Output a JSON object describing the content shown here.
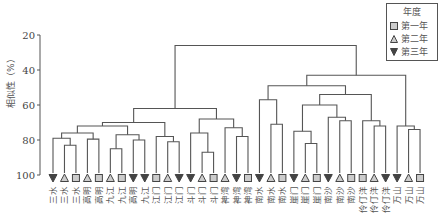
{
  "chart_data": {
    "type": "dendrogram",
    "title": "",
    "ylabel": "相似性（%）",
    "xlabel": "",
    "ylim": [
      20,
      100
    ],
    "yticks": [
      20,
      40,
      60,
      80,
      100
    ],
    "legend": {
      "title": "年度",
      "entries": [
        {
          "label": "第一年",
          "marker": "square"
        },
        {
          "label": "第二年",
          "marker": "triangle-up"
        },
        {
          "label": "第三年",
          "marker": "triangle-down"
        }
      ]
    },
    "leaves": [
      {
        "label": "三水",
        "year": "第三年"
      },
      {
        "label": "三水",
        "year": "第二年"
      },
      {
        "label": "三水",
        "year": "第一年"
      },
      {
        "label": "高明",
        "year": "第二年"
      },
      {
        "label": "高明",
        "year": "第一年"
      },
      {
        "label": "九江",
        "year": "第二年"
      },
      {
        "label": "九江",
        "year": "第一年"
      },
      {
        "label": "高明",
        "year": "第三年"
      },
      {
        "label": "九江",
        "year": "第三年"
      },
      {
        "label": "江门",
        "year": "第一年"
      },
      {
        "label": "江门",
        "year": "第二年"
      },
      {
        "label": "江门",
        "year": "第三年"
      },
      {
        "label": "斗门",
        "year": "第三年"
      },
      {
        "label": "斗门",
        "year": "第二年"
      },
      {
        "label": "斗门",
        "year": "第一年"
      },
      {
        "label": "神湾",
        "year": "第二年"
      },
      {
        "label": "神湾",
        "year": "第三年"
      },
      {
        "label": "神湾",
        "year": "第一年"
      },
      {
        "label": "南水",
        "year": "第三年"
      },
      {
        "label": "南水",
        "year": "第二年"
      },
      {
        "label": "南水",
        "year": "第一年"
      },
      {
        "label": "崖门",
        "year": "第三年"
      },
      {
        "label": "崖门",
        "year": "第二年"
      },
      {
        "label": "崖门",
        "year": "第一年"
      },
      {
        "label": "南沙",
        "year": "第三年"
      },
      {
        "label": "南沙",
        "year": "第二年"
      },
      {
        "label": "南沙",
        "year": "第一年"
      },
      {
        "label": "伶仃洋",
        "year": "第一年"
      },
      {
        "label": "伶仃洋",
        "year": "第二年"
      },
      {
        "label": "伶仃洋",
        "year": "第三年"
      },
      {
        "label": "万山",
        "year": "第三年"
      },
      {
        "label": "万山",
        "year": "第二年"
      },
      {
        "label": "万山",
        "year": "第一年"
      }
    ],
    "merges": [
      {
        "id": "A",
        "children": [
          2,
          3
        ],
        "similarity": 83
      },
      {
        "id": "B",
        "children": [
          1,
          "A"
        ],
        "similarity": 79
      },
      {
        "id": "C",
        "children": [
          4,
          5
        ],
        "similarity": 79.5
      },
      {
        "id": "D",
        "children": [
          "B",
          "C"
        ],
        "similarity": 76
      },
      {
        "id": "E",
        "children": [
          6,
          7
        ],
        "similarity": 85
      },
      {
        "id": "F",
        "children": [
          8,
          9
        ],
        "similarity": 80
      },
      {
        "id": "G",
        "children": [
          "E",
          "F"
        ],
        "similarity": 77
      },
      {
        "id": "H",
        "children": [
          "D",
          "G"
        ],
        "similarity": 72
      },
      {
        "id": "I",
        "children": [
          11,
          12
        ],
        "similarity": 81
      },
      {
        "id": "J",
        "children": [
          10,
          "I"
        ],
        "similarity": 78
      },
      {
        "id": "K",
        "children": [
          14,
          15
        ],
        "similarity": 87
      },
      {
        "id": "L",
        "children": [
          13,
          "K"
        ],
        "similarity": 76
      },
      {
        "id": "M",
        "children": [
          17,
          18
        ],
        "similarity": 78
      },
      {
        "id": "N",
        "children": [
          16,
          "M"
        ],
        "similarity": 73
      },
      {
        "id": "O",
        "children": [
          "L",
          "N"
        ],
        "similarity": 68
      },
      {
        "id": "P",
        "children": [
          "H",
          "J"
        ],
        "similarity": 70
      },
      {
        "id": "Q",
        "children": [
          "P",
          "O"
        ],
        "similarity": 62
      },
      {
        "id": "R",
        "children": [
          20,
          21
        ],
        "similarity": 71
      },
      {
        "id": "S",
        "children": [
          19,
          "R"
        ],
        "similarity": 57
      },
      {
        "id": "T",
        "children": [
          23,
          24
        ],
        "similarity": 82
      },
      {
        "id": "U",
        "children": [
          22,
          "T"
        ],
        "similarity": 75
      },
      {
        "id": "V",
        "children": [
          26,
          27
        ],
        "similarity": 69
      },
      {
        "id": "W",
        "children": [
          25,
          "V"
        ],
        "similarity": 67
      },
      {
        "id": "X",
        "children": [
          "U",
          "W"
        ],
        "similarity": 60
      },
      {
        "id": "Y",
        "children": [
          29,
          30
        ],
        "similarity": 72
      },
      {
        "id": "Z",
        "children": [
          28,
          "Y"
        ],
        "similarity": 69
      },
      {
        "id": "AA",
        "children": [
          "X",
          "Z"
        ],
        "similarity": 54
      },
      {
        "id": "AB",
        "children": [
          32,
          33
        ],
        "similarity": 74
      },
      {
        "id": "AC",
        "children": [
          31,
          "AB"
        ],
        "similarity": 72
      },
      {
        "id": "AD",
        "children": [
          "S",
          "AA"
        ],
        "similarity": 49
      },
      {
        "id": "AE",
        "children": [
          "AD",
          "AC"
        ],
        "similarity": 43
      },
      {
        "id": "ROOT",
        "children": [
          "Q",
          "AE"
        ],
        "similarity": 26
      }
    ],
    "grid": false,
    "legend_position": "top-right"
  },
  "colors": {
    "line": "#555555",
    "marker_square_fill": "#cccccc",
    "marker_up_fill": "#cccccc",
    "marker_down_fill": "#444444"
  }
}
